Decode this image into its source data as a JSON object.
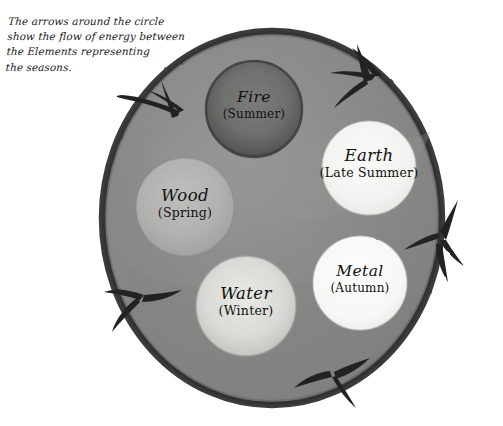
{
  "caption": {
    "text": "The arrows around the circle\nshow the flow of energy between\nthe Elements representing\nthe seasons."
  },
  "diagram": {
    "ring_label": "outer-ring",
    "arrow_count": 5,
    "arrow_direction": "clockwise",
    "colors": {
      "page_background": "#ffffff",
      "ring_outline": "#2f2f2f",
      "ring_fill": "#8d8d8d",
      "arrow": "#262626",
      "label_text": "#111111"
    },
    "elements": [
      {
        "id": "fire",
        "name": "Fire",
        "season": "(Summer)",
        "fill": "#6f6f6f",
        "position": "top"
      },
      {
        "id": "earth",
        "name": "Earth",
        "season": "(Late Summer)",
        "fill": "#f6f6f4",
        "position": "upper-right"
      },
      {
        "id": "metal",
        "name": "Metal",
        "season": "(Autumn)",
        "fill": "#fbfbfa",
        "position": "lower-right"
      },
      {
        "id": "water",
        "name": "Water",
        "season": "(Winter)",
        "fill": "#dcdcd8",
        "position": "bottom"
      },
      {
        "id": "wood",
        "name": "Wood",
        "season": "(Spring)",
        "fill": "#b4b4b2",
        "position": "left"
      }
    ]
  }
}
